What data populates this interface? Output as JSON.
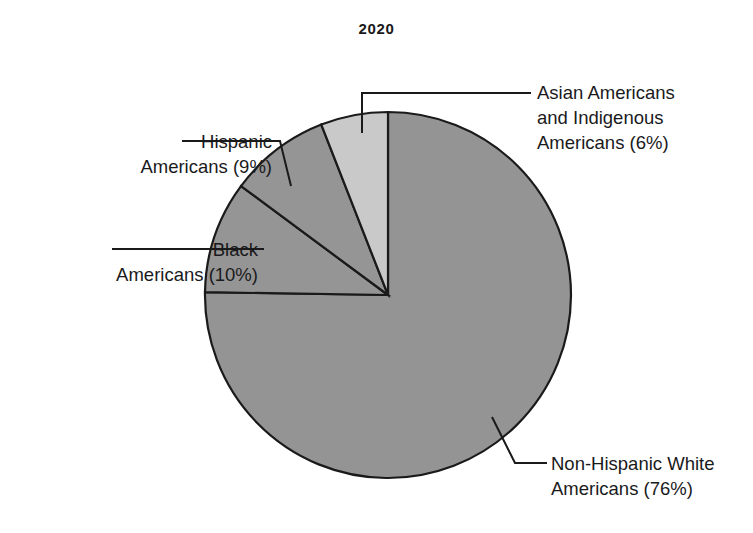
{
  "chart_data": {
    "type": "pie",
    "title": "2020",
    "xlabel": "",
    "ylabel": "",
    "categories": [
      "Asian Americans and Indigenous Americans",
      "Hispanic Americans",
      "Black Americans",
      "Non-Hispanic White Americans"
    ],
    "values": [
      6,
      9,
      10,
      76
    ],
    "units": "percent",
    "slice_colors": [
      "#c9c9c9",
      "#959595",
      "#959595",
      "#949494"
    ],
    "slice_stroke": "#1a1a1a",
    "start_angle_deg": 0,
    "direction": "counterclockwise",
    "legend": "none",
    "grid": false,
    "annotations": [
      "Asian Americans and Indigenous Americans (6%)",
      "Hispanic Americans (9%)",
      "Black Americans (10%)",
      "Non-Hispanic White Americans (76%)"
    ]
  },
  "figure": {
    "title": "2020",
    "background": "#ffffff",
    "callouts": {
      "asian": {
        "line1": "Asian Americans",
        "line2": "and Indigenous",
        "line3": "Americans (6%)"
      },
      "hispanic": {
        "line1": "Hispanic",
        "line2": "Americans (9%)"
      },
      "black": {
        "line1": "Black",
        "line2": "Americans (10%)"
      },
      "white": {
        "line1": "Non-Hispanic White",
        "line2": "Americans (76%)"
      }
    }
  }
}
